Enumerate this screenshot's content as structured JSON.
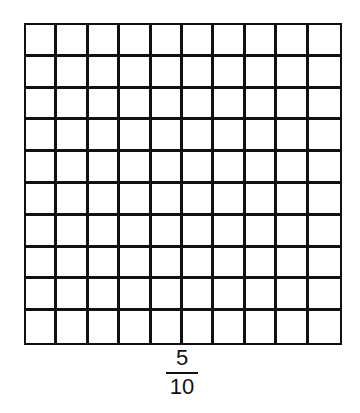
{
  "grid": {
    "rows": 10,
    "columns": 10,
    "shaded_cells": 0,
    "line_color": "#111111",
    "fill_color": "#ffffff"
  },
  "fraction": {
    "numerator": "5",
    "denominator": "10"
  }
}
